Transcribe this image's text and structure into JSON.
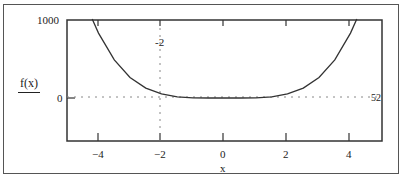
{
  "chart_data": {
    "type": "line",
    "title": "",
    "xlabel": "x",
    "ylabel": "f(x)",
    "xlim": [
      -5,
      5
    ],
    "ylim": [
      -550,
      1000
    ],
    "x_ticks": [
      -4,
      -2,
      0,
      2,
      4
    ],
    "x_tick_labels": [
      "−4",
      "−2",
      "0",
      "2",
      "4"
    ],
    "y_tick_labels": [
      "1000",
      "0"
    ],
    "grid": false,
    "legend": null,
    "series": [
      {
        "name": "f(x)",
        "x": [
          -4.2,
          -4,
          -3.5,
          -3,
          -2.5,
          -2,
          -1.5,
          -1,
          -0.5,
          0,
          0.5,
          1,
          1.5,
          2,
          2.5,
          3,
          3.5,
          4,
          4.2
        ],
        "values": [
          1011,
          832,
          488,
          263,
          127,
          52,
          16,
          3,
          0,
          0,
          0,
          3,
          16,
          52,
          127,
          263,
          488,
          832,
          1011
        ]
      }
    ],
    "annotations": {
      "marker_x": -2,
      "marker_x_label": "-2",
      "marker_y": 52,
      "marker_y_label": "52"
    }
  },
  "labels": {
    "y_top": "1000",
    "y_zero": "0",
    "y_axis": "f(x)",
    "x_axis": "x",
    "marker_x": "-2",
    "marker_y": "52",
    "xt0": "−4",
    "xt1": "−2",
    "xt2": "0",
    "xt3": "2",
    "xt4": "4"
  }
}
